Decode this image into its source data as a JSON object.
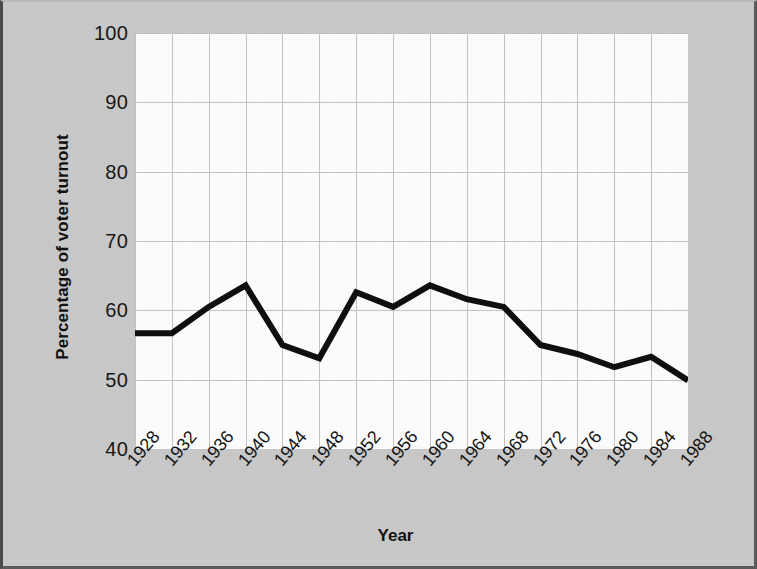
{
  "chart_data": {
    "type": "line",
    "title": "",
    "xlabel": "Year",
    "ylabel": "Percentage of voter turnout",
    "x": [
      1928,
      1932,
      1936,
      1940,
      1944,
      1948,
      1952,
      1956,
      1960,
      1964,
      1968,
      1972,
      1976,
      1980,
      1984,
      1988
    ],
    "categories": [
      "1928",
      "1932",
      "1936",
      "1940",
      "1944",
      "1948",
      "1952",
      "1956",
      "1960",
      "1964",
      "1968",
      "1972",
      "1976",
      "1980",
      "1984",
      "1988"
    ],
    "values": [
      56.7,
      56.7,
      60.5,
      63.6,
      55.0,
      53.1,
      62.6,
      60.5,
      63.6,
      61.6,
      60.5,
      55.0,
      53.7,
      51.8,
      53.3,
      49.9
    ],
    "series": [
      {
        "name": "Percentage of voter turnout",
        "values": [
          56.7,
          56.7,
          60.5,
          63.6,
          55.0,
          53.1,
          62.6,
          60.5,
          63.6,
          61.6,
          60.5,
          55.0,
          53.7,
          51.8,
          53.3,
          49.9
        ]
      }
    ],
    "ylim": [
      40,
      100
    ],
    "yticks": [
      40,
      50,
      60,
      70,
      80,
      90,
      100
    ],
    "ytick_labels": [
      "40",
      "50",
      "60",
      "70",
      "80",
      "90",
      "100"
    ],
    "xlim": [
      1928,
      1988
    ],
    "grid": true,
    "legend": false,
    "line_color": "#0d0d0d",
    "line_width": 6,
    "plot_background": "#fdfdfd",
    "grid_color": "#c4c4c4",
    "page_background": "#c9c9c9"
  }
}
